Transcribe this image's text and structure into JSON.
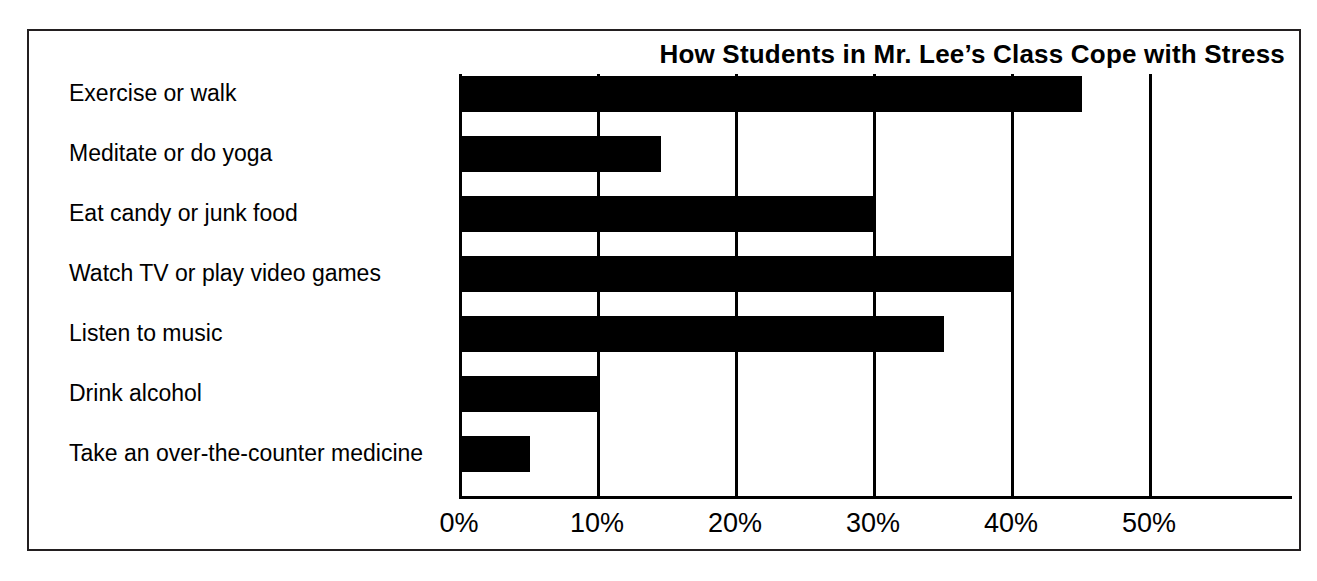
{
  "chart_data": {
    "type": "bar",
    "orientation": "horizontal",
    "title": "How Students in Mr. Lee’s Class Cope with Stress",
    "xlabel": "",
    "ylabel": "",
    "categories": [
      "Exercise or walk",
      "Meditate or do yoga",
      "Eat candy or junk food",
      "Watch TV or play video games",
      "Listen to music",
      "Drink alcohol",
      "Take an over-the-counter medicine"
    ],
    "values": [
      45,
      14.5,
      30,
      40,
      35,
      10,
      5
    ],
    "value_suffix": "%",
    "xlim": [
      0,
      50
    ],
    "xticks": [
      0,
      10,
      20,
      30,
      40,
      50
    ],
    "xtick_labels": [
      "0%",
      "10%",
      "20%",
      "30%",
      "40%",
      "50%"
    ],
    "grid": "vertical",
    "legend": "none",
    "bar_color": "#000000",
    "background_color": "#ffffff",
    "frame_color": "#231f20"
  }
}
